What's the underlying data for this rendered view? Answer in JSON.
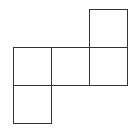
{
  "diagram": {
    "type": "cube-net",
    "cell_size": 38,
    "origin": {
      "x": 13,
      "y": 9
    },
    "stroke_color": "#333333",
    "background": "#ffffff",
    "cells": [
      {
        "col": 2,
        "row": 0
      },
      {
        "col": 0,
        "row": 1
      },
      {
        "col": 1,
        "row": 1
      },
      {
        "col": 2,
        "row": 1
      },
      {
        "col": 0,
        "row": 2
      }
    ]
  }
}
